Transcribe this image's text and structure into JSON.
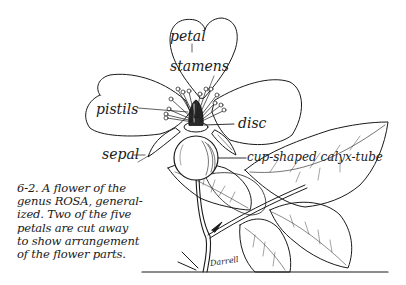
{
  "figure": {
    "labels": {
      "petal": "petal",
      "stamens": "stamens",
      "pistils": "pistils",
      "disc": "disc",
      "sepal": "sepal",
      "calyx_tube": "cup-shaped calyx-tube"
    },
    "caption_lines": [
      "6-2. A flower of the",
      "genus ROSA, general-",
      "ized. Two of the five",
      "petals are cut away",
      "to show arrangement",
      "of the flower parts."
    ],
    "signature": "Darrell",
    "colors": {
      "ink": "#1a1a1a",
      "paper": "#ffffff"
    }
  }
}
